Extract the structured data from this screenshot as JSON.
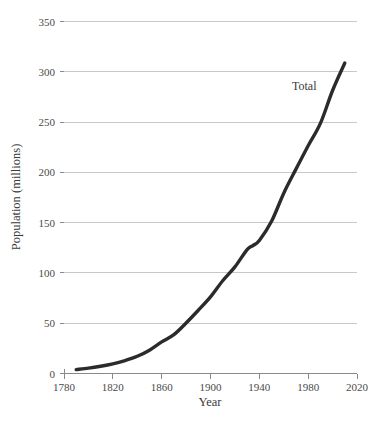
{
  "chart_data": {
    "type": "line",
    "title": "",
    "xlabel": "Year",
    "ylabel": "Population (millions)",
    "xlim": [
      1780,
      2020
    ],
    "ylim": [
      0,
      350
    ],
    "grid": true,
    "legend_position": "inline-annotation",
    "xticks": [
      "1780",
      "1820",
      "1860",
      "1900",
      "1940",
      "1980",
      "2020"
    ],
    "xtick_values": [
      1780,
      1820,
      1860,
      1900,
      1940,
      1980,
      2020
    ],
    "yticks": [
      "0",
      "50",
      "100",
      "150",
      "200",
      "250",
      "300",
      "350"
    ],
    "ytick_values": [
      0,
      50,
      100,
      150,
      200,
      250,
      300,
      350
    ],
    "series": [
      {
        "name": "Total",
        "color": "#2b2b2b",
        "x": [
          1790,
          1800,
          1810,
          1820,
          1830,
          1840,
          1850,
          1860,
          1870,
          1880,
          1890,
          1900,
          1910,
          1920,
          1930,
          1935,
          1940,
          1950,
          1960,
          1970,
          1980,
          1990,
          2000,
          2010
        ],
        "values": [
          3.9,
          5.3,
          7.2,
          9.6,
          12.9,
          17.1,
          23.2,
          31.4,
          38.6,
          50.2,
          62.9,
          76.2,
          92.2,
          106.0,
          123.2,
          127.4,
          132.2,
          151.3,
          179.3,
          203.2,
          226.5,
          248.7,
          281.4,
          308.7
        ]
      }
    ],
    "annotations": [
      {
        "text": "Total",
        "x": 1975,
        "y": 288
      }
    ]
  },
  "colors": {
    "curve": "#2b2b2b",
    "gridline": "#c9c9c9",
    "axis": "#8a8a8a",
    "text": "#3a3a3a",
    "background": "#ffffff"
  }
}
